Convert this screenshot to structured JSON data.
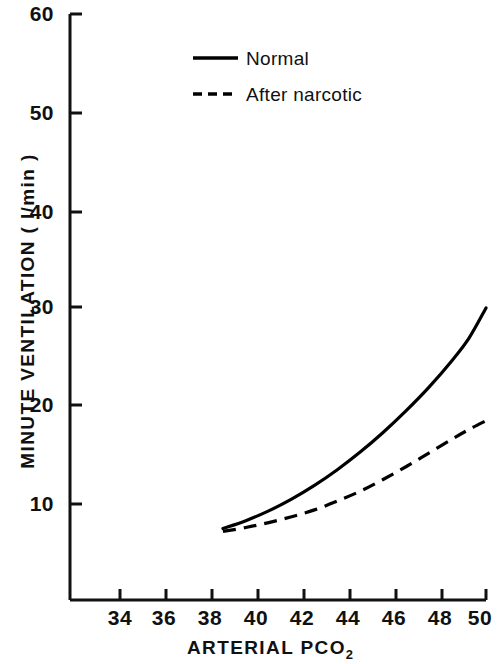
{
  "chart_data": {
    "type": "line",
    "title": "",
    "xlabel": "ARTERIAL  PCO2",
    "xlabel_main": "ARTERIAL   PCO",
    "xlabel_sub": "2",
    "ylabel": "MINUTE  VENTILATION ( l/min )",
    "xlim": [
      32,
      50
    ],
    "ylim": [
      0,
      60
    ],
    "xticks": [
      34,
      36,
      38,
      40,
      42,
      44,
      46,
      48,
      50
    ],
    "yticks": [
      10,
      20,
      30,
      40,
      50,
      60
    ],
    "grid": false,
    "legend_position": "top-center",
    "series": [
      {
        "name": "Normal",
        "style": "solid",
        "color": "#000000",
        "x": [
          38.5,
          39.5,
          40.5,
          41.5,
          42.5,
          43.5,
          44.5,
          45.5,
          46.5,
          47.5,
          48.5,
          49.25,
          50.0
        ],
        "values": [
          7.5,
          8.3,
          9.3,
          10.5,
          11.9,
          13.5,
          15.3,
          17.3,
          19.5,
          21.9,
          24.6,
          26.9,
          30.0
        ]
      },
      {
        "name": "After narcotic",
        "style": "dashed",
        "color": "#000000",
        "x": [
          38.5,
          39.5,
          40.5,
          41.5,
          42.5,
          43.5,
          44.5,
          45.5,
          46.5,
          47.5,
          48.5,
          49.25,
          50.0
        ],
        "values": [
          7.2,
          7.6,
          8.1,
          8.7,
          9.4,
          10.3,
          11.3,
          12.5,
          13.8,
          15.2,
          16.6,
          17.6,
          18.5
        ]
      }
    ]
  },
  "legend": {
    "items": [
      {
        "label": "Normal",
        "style": "solid"
      },
      {
        "label": "After narcotic",
        "style": "dashed"
      }
    ]
  },
  "axes": {
    "y_tick_labels": [
      "60",
      "50",
      "40",
      "30",
      "20",
      "10"
    ],
    "x_tick_labels": [
      "34",
      "36",
      "38",
      "40",
      "42",
      "44",
      "46",
      "48",
      "50"
    ]
  },
  "colors": {
    "axis": "#111111",
    "curve": "#000000",
    "background": "#ffffff"
  }
}
